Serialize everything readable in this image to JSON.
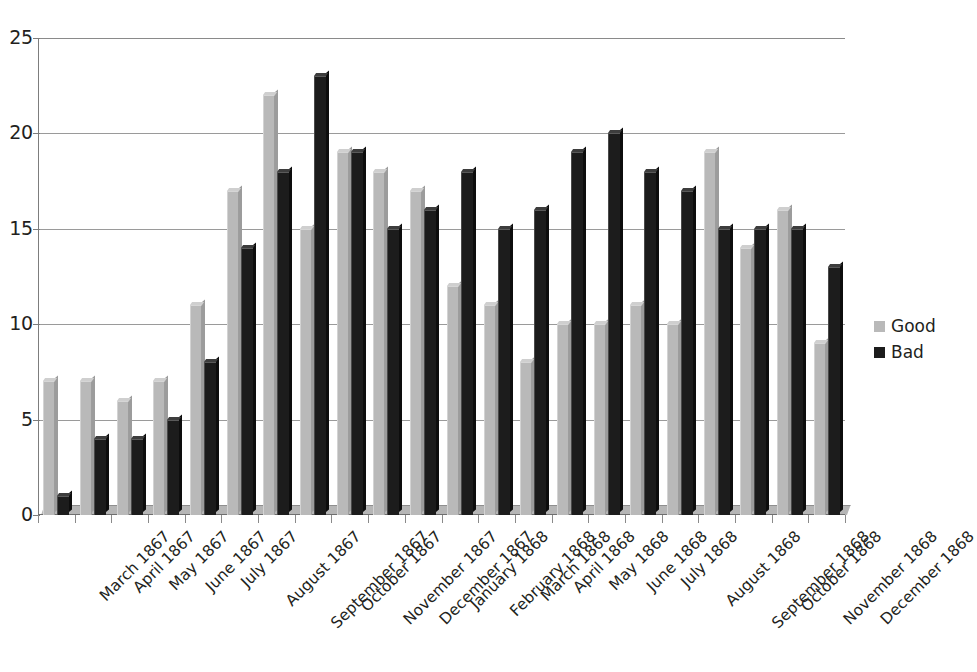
{
  "chart_data": {
    "type": "bar",
    "title": "",
    "subtitle": "",
    "xlabel": "",
    "ylabel": "",
    "ylim": [
      0,
      25
    ],
    "yticks": [
      0,
      5,
      10,
      15,
      20,
      25
    ],
    "grid": true,
    "legend_position": "right",
    "categories": [
      "March 1867",
      "April 1867",
      "May 1867",
      "June 1867",
      "July 1867",
      "August 1867",
      "September 1867",
      "October 1867",
      "November 1867",
      "December 1867",
      "January 1868",
      "February 1868",
      "March 1868",
      "April 1868",
      "May 1868",
      "June 1868",
      "July 1868",
      "August 1868",
      "September 1868",
      "October 1868",
      "November 1868",
      "December 1868"
    ],
    "series": [
      {
        "name": "Good",
        "color": "#b9b9b9",
        "values": [
          7,
          7,
          6,
          7,
          11,
          17,
          22,
          15,
          19,
          18,
          17,
          12,
          11,
          8,
          10,
          10,
          11,
          10,
          19,
          14,
          16,
          9
        ]
      },
      {
        "name": "Bad",
        "color": "#1c1c1c",
        "values": [
          1,
          4,
          4,
          5,
          8,
          14,
          18,
          23,
          19,
          15,
          16,
          18,
          15,
          16,
          19,
          20,
          18,
          17,
          15,
          15,
          15,
          13
        ]
      }
    ]
  },
  "legend": {
    "entries": [
      {
        "label": "Good"
      },
      {
        "label": "Bad"
      }
    ]
  }
}
